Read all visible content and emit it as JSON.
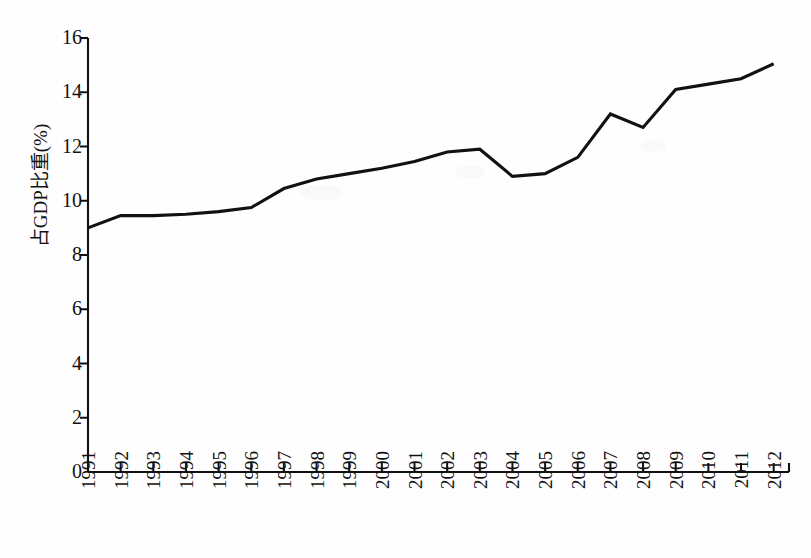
{
  "chart_data": {
    "type": "line",
    "title": "",
    "xlabel": "",
    "ylabel": "占GDP比重(%)",
    "categories": [
      "1991",
      "1992",
      "1993",
      "1994",
      "1995",
      "1996",
      "1997",
      "1998",
      "1999",
      "2000",
      "2001",
      "2002",
      "2003",
      "2004",
      "2005",
      "2006",
      "2007",
      "2008",
      "2009",
      "2010",
      "2011",
      "2012"
    ],
    "values": [
      9.0,
      9.45,
      9.45,
      9.5,
      9.6,
      9.75,
      10.45,
      10.8,
      11.0,
      11.2,
      11.45,
      11.8,
      11.9,
      10.9,
      11.0,
      11.6,
      13.2,
      12.7,
      14.1,
      14.3,
      14.5,
      15.05
    ],
    "series": [
      {
        "name": "占GDP比重(%)",
        "values": [
          9.0,
          9.45,
          9.45,
          9.5,
          9.6,
          9.75,
          10.45,
          10.8,
          11.0,
          11.2,
          11.45,
          11.8,
          11.9,
          10.9,
          11.0,
          11.6,
          13.2,
          12.7,
          14.1,
          14.3,
          14.5,
          15.05
        ],
        "color": "#111111"
      }
    ],
    "ylim": [
      0,
      16
    ],
    "ytick_values": [
      0,
      2,
      4,
      6,
      8,
      10,
      12,
      14,
      16
    ],
    "ytick_labels": [
      "0",
      "2",
      "4",
      "6",
      "8",
      "10",
      "12",
      "14",
      "16"
    ],
    "grid": false,
    "legend": false,
    "legend_position": "none",
    "line_color": "#111111",
    "axis_color": "#111111",
    "background_color": "#fefefe"
  },
  "axes": {
    "y_axis_title": "占GDP比重(%)"
  }
}
